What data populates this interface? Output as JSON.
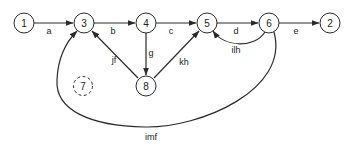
{
  "diagram": {
    "type": "directed-graph",
    "nodes": [
      {
        "id": "1",
        "label": "1",
        "x": 24,
        "y": 23,
        "style": "solid"
      },
      {
        "id": "3",
        "label": "3",
        "x": 84,
        "y": 23,
        "style": "solid"
      },
      {
        "id": "4",
        "label": "4",
        "x": 146,
        "y": 23,
        "style": "solid"
      },
      {
        "id": "5",
        "label": "5",
        "x": 207,
        "y": 23,
        "style": "solid"
      },
      {
        "id": "6",
        "label": "6",
        "x": 269,
        "y": 23,
        "style": "solid"
      },
      {
        "id": "2",
        "label": "2",
        "x": 330,
        "y": 23,
        "style": "solid"
      },
      {
        "id": "8",
        "label": "8",
        "x": 146,
        "y": 86,
        "style": "solid"
      },
      {
        "id": "7",
        "label": "7",
        "x": 83,
        "y": 86,
        "style": "dashed"
      }
    ],
    "edges": [
      {
        "from": "1",
        "to": "3",
        "label": "a"
      },
      {
        "from": "3",
        "to": "4",
        "label": "b"
      },
      {
        "from": "4",
        "to": "5",
        "label": "c"
      },
      {
        "from": "5",
        "to": "6",
        "label": "d"
      },
      {
        "from": "6",
        "to": "2",
        "label": "e"
      },
      {
        "from": "4",
        "to": "8",
        "label": "g"
      },
      {
        "from": "8",
        "to": "3",
        "label": "jf"
      },
      {
        "from": "8",
        "to": "5",
        "label": "kh"
      },
      {
        "from": "6",
        "to": "5",
        "label": "ilh"
      },
      {
        "from": "6",
        "to": "3",
        "label": "imf"
      }
    ]
  },
  "labels": {
    "n1": "1",
    "n2": "2",
    "n3": "3",
    "n4": "4",
    "n5": "5",
    "n6": "6",
    "n7": "7",
    "n8": "8",
    "a": "a",
    "b": "b",
    "c": "c",
    "d": "d",
    "e": "e",
    "g": "g",
    "jf": "jf",
    "kh": "kh",
    "ilh": "ilh",
    "imf": "imf"
  },
  "colors": {
    "stroke": "#2a2a2a",
    "background": "#ffffff"
  }
}
